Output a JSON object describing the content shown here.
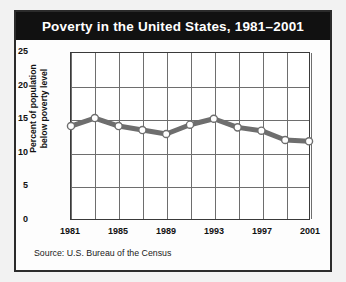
{
  "card": {
    "title": "Poverty in the United States, 1981–2001",
    "source": "Source: U.S. Bureau of the Census"
  },
  "chart_data": {
    "type": "line",
    "title": "Poverty in the United States, 1981–2001",
    "xlabel": "",
    "ylabel": "Percent of population below poverty level",
    "ylabel_lines": [
      "Percent of population",
      "below poverty level"
    ],
    "x": [
      1981,
      1983,
      1985,
      1987,
      1989,
      1991,
      1993,
      1995,
      1997,
      1999,
      2001
    ],
    "values": [
      14.0,
      15.2,
      14.0,
      13.4,
      12.8,
      14.2,
      15.1,
      13.8,
      13.3,
      11.9,
      11.7
    ],
    "xlim": [
      1981,
      2001
    ],
    "ylim": [
      0,
      25
    ],
    "yticks": [
      0,
      5,
      10,
      15,
      20,
      25
    ],
    "ytick_labels": [
      "0",
      "5",
      "10",
      "15",
      "20",
      "25"
    ],
    "xticks": [
      1981,
      1985,
      1989,
      1993,
      1997,
      2001
    ],
    "xtick_labels": [
      "1981",
      "1985",
      "1989",
      "1993",
      "1997",
      "2001"
    ],
    "grid": true,
    "legend": "none",
    "series_color": "#6e6e6e",
    "marker_fill": "#ffffff",
    "marker_edge": "#6e6e6e",
    "title_bar_color": "#111111",
    "title_text_color": "#ffffff"
  }
}
